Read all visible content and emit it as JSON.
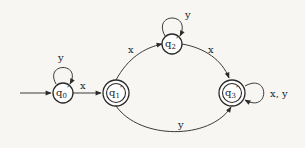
{
  "diagram": {
    "type": "finite-automaton",
    "colors": {
      "stroke": "#2a2a2a",
      "background": "#f7f6f2"
    },
    "states": [
      {
        "id": "q0",
        "label": "q",
        "subscript": "0",
        "prime": "′",
        "accepting": false,
        "initial": true
      },
      {
        "id": "q1",
        "label": "q",
        "subscript": "1",
        "prime": "′",
        "accepting": true,
        "initial": false
      },
      {
        "id": "q2",
        "label": "q",
        "subscript": "2",
        "prime": "′",
        "accepting": false,
        "initial": false
      },
      {
        "id": "q3",
        "label": "q",
        "subscript": "3",
        "prime": "′",
        "accepting": true,
        "initial": false
      }
    ],
    "transitions": [
      {
        "from": "q0",
        "to": "q0",
        "label": "y"
      },
      {
        "from": "q0",
        "to": "q1",
        "label": "x"
      },
      {
        "from": "q1",
        "to": "q2",
        "label": "x"
      },
      {
        "from": "q2",
        "to": "q2",
        "label": "y"
      },
      {
        "from": "q2",
        "to": "q3",
        "label": "x"
      },
      {
        "from": "q1",
        "to": "q3",
        "label": "y"
      },
      {
        "from": "q3",
        "to": "q3",
        "label": "x, y"
      }
    ]
  }
}
